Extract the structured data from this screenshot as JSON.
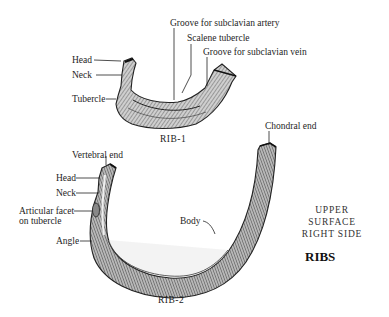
{
  "figure": {
    "title": "RIBS",
    "view_note_line1": "UPPER SURFACE",
    "view_note_line2": "RIGHT SIDE"
  },
  "rib1": {
    "caption": "RIB-1",
    "labels": {
      "head": "Head",
      "neck": "Neck",
      "tubercle": "Tubercle",
      "groove_artery": "Groove for subclavian artery",
      "scalene_tubercle": "Scalene tubercle",
      "groove_vein": "Groove for subclavian vein"
    }
  },
  "rib2": {
    "caption": "RIB-2",
    "labels": {
      "vertebral_end": "Vertebral end",
      "head": "Head",
      "neck": "Neck",
      "articular_facet_line1": "Articular facet",
      "articular_facet_line2": "on tubercle",
      "angle": "Angle",
      "body": "Body",
      "chondral_end": "Chondral end"
    }
  }
}
